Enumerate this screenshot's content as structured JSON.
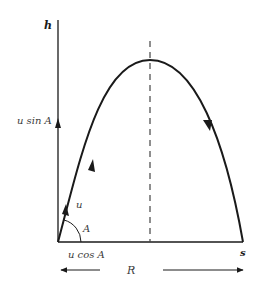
{
  "diagram": {
    "type": "projectile-trajectory",
    "axes": {
      "vertical_label": "h",
      "horizontal_label": "s"
    },
    "labels": {
      "vertical_component": "u sin A",
      "horizontal_component": "u cos A",
      "initial_velocity": "u",
      "launch_angle": "A",
      "range": "R"
    },
    "colors": {
      "stroke": "#1a1a1a",
      "text": "#3a3a3a",
      "background": "#ffffff"
    }
  }
}
